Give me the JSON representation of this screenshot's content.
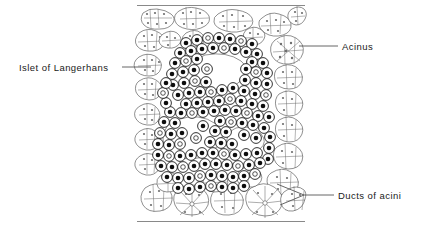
{
  "figure": {
    "background_color": "#ffffff",
    "ink_color": "#1a1a1a",
    "leader_color": "#555555"
  },
  "labels": [
    {
      "id": "islet-of-langerhans",
      "text": "Islet of Langerhans",
      "position": "left",
      "text_x": 19,
      "text_y": 71,
      "anchor": "start",
      "leader": "M 122 67 L 151 67"
    },
    {
      "id": "acinus",
      "text": "Acinus",
      "position": "top-right",
      "text_x": 342,
      "text_y": 50,
      "anchor": "start",
      "leader": "M 299 46 L 338 46"
    },
    {
      "id": "ducts-of-acini",
      "text": "Ducts of acini",
      "position": "bottom-right",
      "text_x": 338,
      "text_y": 199,
      "anchor": "start",
      "leader": "M 334 195 L 304 195 M 304 195 L 277 184 M 304 195 L 280 205"
    }
  ],
  "illustration": {
    "bounds": {
      "x": 137,
      "y": 5,
      "width": 168,
      "height": 217
    },
    "top_border_y": 5,
    "bottom_border_y": 221,
    "regions": [
      {
        "name": "acinar-tissue",
        "description": "Pale outlined exocrine acini with small nuclei surrounding the islet"
      },
      {
        "name": "islet-of-langerhans",
        "description": "Central mass of densely packed cells with dark round nuclei"
      },
      {
        "name": "ducts-of-acini",
        "description": "Star-shaped radiating duct profiles at lower right of the acinar field"
      }
    ]
  }
}
